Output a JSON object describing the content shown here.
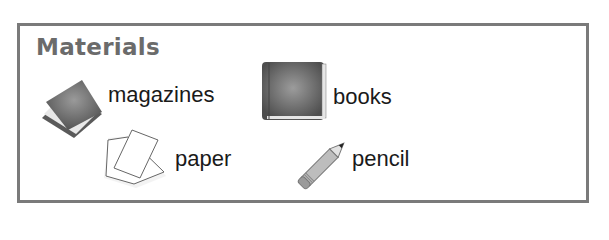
{
  "title": "Materials",
  "items": [
    {
      "label": "magazines",
      "icon": "magazines-icon"
    },
    {
      "label": "books",
      "icon": "book-icon"
    },
    {
      "label": "paper",
      "icon": "paper-icon"
    },
    {
      "label": "pencil",
      "icon": "pencil-icon"
    }
  ],
  "colors": {
    "border": "#7a7a7a",
    "title": "#6b6b6b",
    "text": "#1a1a1a"
  }
}
